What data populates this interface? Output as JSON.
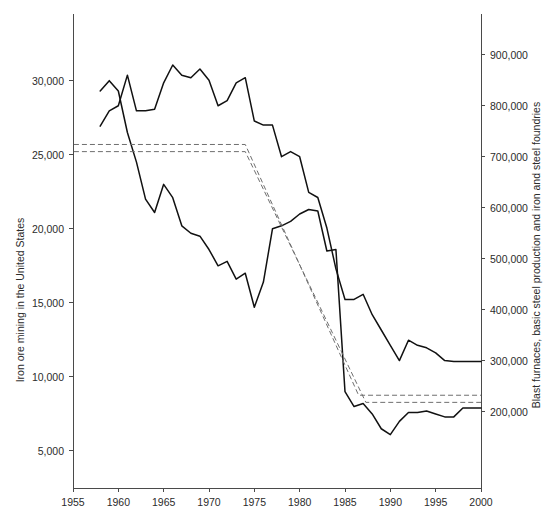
{
  "chart_data": {
    "type": "line",
    "title": "",
    "subtitle": "",
    "xlabel": "",
    "ylabel": "Iron ore mining in the United States",
    "y2label": "Blast furnaces, basic steel production and iron and steel foundries",
    "grid": false,
    "legend": "none",
    "xlim": [
      1955,
      2000
    ],
    "xticks": [
      1955,
      1960,
      1965,
      1970,
      1975,
      1980,
      1985,
      1990,
      1995,
      2000
    ],
    "xticklabels": [
      "1955",
      "1960",
      "1965",
      "1970",
      "1975",
      "1980",
      "1985",
      "1990",
      "1995",
      "2000"
    ],
    "ylim": [
      2500,
      34500
    ],
    "yticks": [
      5000,
      10000,
      15000,
      20000,
      25000,
      30000
    ],
    "yticklabels": [
      "5,000",
      "10,000",
      "15,000",
      "20,000",
      "25,000",
      "30,000"
    ],
    "y2lim": [
      50000,
      980000
    ],
    "y2ticks": [
      200000,
      300000,
      400000,
      500000,
      600000,
      700000,
      800000,
      900000
    ],
    "y2ticklabels": [
      "200,000",
      "300,000",
      "400,000",
      "500,000",
      "600,000",
      "700,000",
      "800,000",
      "900,000"
    ],
    "series": [
      {
        "name": "Blast furnaces, basic steel production and iron and steel foundries",
        "axis": "right",
        "style": "solid",
        "color": "#111111",
        "x": [
          1958,
          1959,
          1960,
          1961,
          1962,
          1963,
          1964,
          1965,
          1966,
          1967,
          1968,
          1969,
          1970,
          1971,
          1972,
          1973,
          1974,
          1975,
          1976,
          1977,
          1978,
          1979,
          1980,
          1981,
          1982,
          1983,
          1984,
          1985,
          1986,
          1987,
          1988,
          1989,
          1990,
          1991,
          1992,
          1993,
          1994,
          1995,
          1996,
          1997,
          1998,
          1999,
          2000
        ],
        "values": [
          760000,
          790000,
          800000,
          860000,
          790000,
          790000,
          793000,
          845000,
          880000,
          860000,
          855000,
          872000,
          850000,
          800000,
          810000,
          845000,
          855000,
          770000,
          762000,
          762000,
          700000,
          710000,
          700000,
          630000,
          620000,
          560000,
          480000,
          420000,
          420000,
          430000,
          390000,
          360000,
          330000,
          300000,
          340000,
          330000,
          325000,
          315000,
          300000,
          298000,
          298000,
          298000,
          298000
        ]
      },
      {
        "name": "Iron ore mining in the United States",
        "axis": "left",
        "style": "solid",
        "color": "#111111",
        "x": [
          1958,
          1959,
          1960,
          1961,
          1962,
          1963,
          1964,
          1965,
          1966,
          1967,
          1968,
          1969,
          1970,
          1971,
          1972,
          1973,
          1974,
          1975,
          1976,
          1977,
          1978,
          1979,
          1980,
          1981,
          1982,
          1983,
          1984,
          1985,
          1986,
          1987,
          1988,
          1989,
          1990,
          1991,
          1992,
          1993,
          1994,
          1995,
          1996,
          1997,
          1998,
          1999,
          2000
        ],
        "values": [
          29300,
          30000,
          29300,
          26500,
          24500,
          22000,
          21100,
          23000,
          22100,
          20200,
          19700,
          19500,
          18600,
          17500,
          17800,
          16600,
          17000,
          14700,
          16400,
          20000,
          20200,
          20500,
          21000,
          21300,
          21200,
          18500,
          18600,
          9000,
          8000,
          8200,
          7500,
          6500,
          6100,
          7000,
          7600,
          7600,
          7700,
          7500,
          7300,
          7300,
          7900,
          7900,
          7900
        ]
      },
      {
        "name": "trend-dashed-upper",
        "axis": "right",
        "style": "dashed",
        "color": "#6f6f6f",
        "x": [
          1955.1,
          1974,
          1986.5,
          2000
        ],
        "values": [
          724000,
          724000,
          232000,
          232000
        ]
      },
      {
        "name": "trend-dashed-lower",
        "axis": "right",
        "style": "dashed",
        "color": "#6f6f6f",
        "x": [
          1955.1,
          1974,
          1987.3,
          2000
        ],
        "values": [
          710000,
          710000,
          218000,
          218000
        ]
      }
    ]
  }
}
